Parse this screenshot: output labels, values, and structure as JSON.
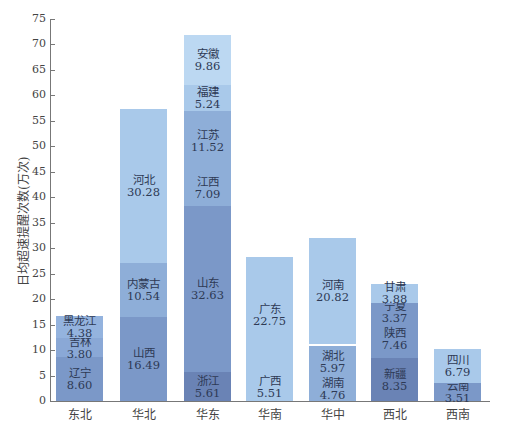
{
  "chart_data": {
    "type": "bar",
    "stacked": true,
    "title": "",
    "xlabel": "",
    "ylabel": "日均超速提醒次数(万次)",
    "ylim": [
      0,
      75
    ],
    "yticks": [
      0,
      5,
      10,
      15,
      20,
      25,
      30,
      35,
      40,
      45,
      50,
      55,
      60,
      65,
      70,
      75
    ],
    "grid": false,
    "legend": null,
    "categories": [
      "东北",
      "华北",
      "华东",
      "华南",
      "华中",
      "西北",
      "西南"
    ],
    "stacks": [
      {
        "category": "东北",
        "segments": [
          {
            "name": "辽宁",
            "value": 8.6,
            "label": "8.60",
            "color": "#7b98c8"
          },
          {
            "name": "吉林",
            "value": 3.8,
            "label": "3.80",
            "color": "#8aa8d6"
          },
          {
            "name": "黑龙江",
            "value": 4.38,
            "label": "4.38",
            "color": "#94b3de"
          }
        ]
      },
      {
        "category": "华北",
        "segments": [
          {
            "name": "山西",
            "value": 16.49,
            "label": "16.49",
            "color": "#7b98c8"
          },
          {
            "name": "内蒙古",
            "value": 10.54,
            "label": "10.54",
            "color": "#8eaed8"
          },
          {
            "name": "河北",
            "value": 30.28,
            "label": "30.28",
            "color": "#a9c9ea"
          }
        ]
      },
      {
        "category": "华东",
        "segments": [
          {
            "name": "浙江",
            "value": 5.61,
            "label": "5.61",
            "color": "#6a83b5"
          },
          {
            "name": "山东",
            "value": 32.63,
            "label": "32.63",
            "color": "#7b98c8"
          },
          {
            "name": "江西",
            "value": 7.09,
            "label": "7.09",
            "color": "#8eaed8"
          },
          {
            "name": "江苏",
            "value": 11.52,
            "label": "11.52",
            "color": "#8eaed8"
          },
          {
            "name": "福建",
            "value": 5.24,
            "label": "5.24",
            "color": "#a9c9ea"
          },
          {
            "name": "安徽",
            "value": 9.86,
            "label": "9.86",
            "color": "#bcd8f2"
          }
        ]
      },
      {
        "category": "华南",
        "segments": [
          {
            "name": "广西",
            "value": 5.51,
            "label": "5.51",
            "color": "#a9c9ea"
          },
          {
            "name": "广东",
            "value": 22.75,
            "label": "22.75",
            "color": "#a9c9ea"
          }
        ]
      },
      {
        "category": "华中",
        "segments": [
          {
            "name": "湖南",
            "value": 4.76,
            "label": "4.76",
            "color": "#8eaed8"
          },
          {
            "name": "湖北",
            "value": 5.97,
            "label": "5.97",
            "color": "#8eaed8"
          },
          {
            "name": "河南",
            "value": 20.82,
            "label": "20.82",
            "color": "#a9c9ea"
          }
        ]
      },
      {
        "category": "西北",
        "segments": [
          {
            "name": "新疆",
            "value": 8.35,
            "label": "8.35",
            "color": "#6a83b5"
          },
          {
            "name": "陕西",
            "value": 7.46,
            "label": "7.46",
            "color": "#7b98c8"
          },
          {
            "name": "宁夏",
            "value": 3.37,
            "label": "3.37",
            "color": "#7b98c8"
          },
          {
            "name": "甘肃",
            "value": 3.88,
            "label": "3.88",
            "color": "#a9c9ea"
          }
        ]
      },
      {
        "category": "西南",
        "segments": [
          {
            "name": "云南",
            "value": 3.51,
            "label": "3.51",
            "color": "#7b98c8"
          },
          {
            "name": "四川",
            "value": 6.79,
            "label": "6.79",
            "color": "#a9c9ea"
          }
        ]
      }
    ]
  }
}
